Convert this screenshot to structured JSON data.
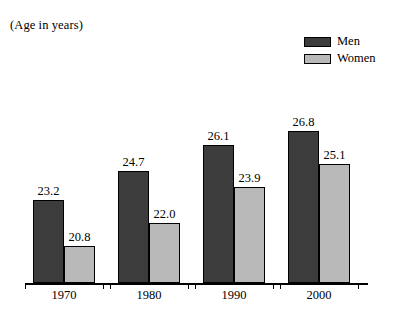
{
  "figure": {
    "axis_caption": "(Age in years)"
  },
  "legend": {
    "position": "top-right",
    "items": [
      {
        "label": "Men",
        "color": "#3c3c3c"
      },
      {
        "label": "Women",
        "color": "#b9b9b9"
      }
    ]
  },
  "chart_data": {
    "type": "bar",
    "title": "",
    "subtitle": "",
    "xlabel": "",
    "ylabel": "(Age in years)",
    "categories": [
      "1970",
      "1980",
      "1990",
      "2000"
    ],
    "series": [
      {
        "name": "Men",
        "color": "#3c3c3c",
        "values": [
          23.2,
          24.7,
          26.1,
          26.8
        ]
      },
      {
        "name": "Women",
        "color": "#b9b9b9",
        "values": [
          20.8,
          22.0,
          23.9,
          25.1
        ]
      }
    ],
    "value_labels": [
      [
        "23.2",
        "20.8"
      ],
      [
        "24.7",
        "22.0"
      ],
      [
        "26.1",
        "23.9"
      ],
      [
        "26.8",
        "25.1"
      ]
    ],
    "axis_baseline_value": 18.9,
    "ylim": [
      18.9,
      28.0
    ],
    "grid": false,
    "legend_position": "top-right"
  }
}
